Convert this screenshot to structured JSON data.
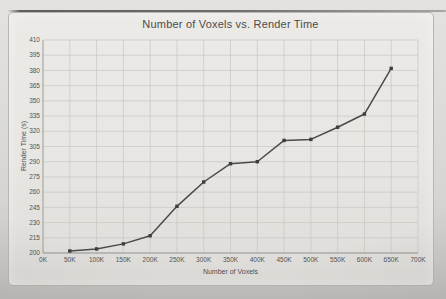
{
  "chart_data": {
    "type": "line",
    "title": "Number of Voxels vs. Render Time",
    "xlabel": "Number of Voxels",
    "ylabel": "Render Time (s)",
    "xlim": [
      0,
      700000
    ],
    "ylim": [
      200,
      410
    ],
    "grid": true,
    "legend": "none",
    "x_ticks": [
      "0K",
      "50K",
      "100K",
      "150K",
      "200K",
      "250K",
      "300K",
      "350K",
      "400K",
      "450K",
      "500K",
      "550K",
      "600K",
      "650K",
      "700K"
    ],
    "x_tick_values": [
      0,
      50000,
      100000,
      150000,
      200000,
      250000,
      300000,
      350000,
      400000,
      450000,
      500000,
      550000,
      600000,
      650000,
      700000
    ],
    "y_ticks": [
      200,
      215,
      230,
      245,
      260,
      275,
      290,
      305,
      320,
      335,
      350,
      365,
      380,
      395,
      410
    ],
    "series": [
      {
        "name": "Render Time",
        "x": [
          50000,
          100000,
          150000,
          200000,
          250000,
          300000,
          350000,
          400000,
          450000,
          500000,
          550000,
          600000,
          650000
        ],
        "values": [
          202,
          204,
          209,
          217,
          246,
          270,
          288,
          290,
          311,
          312,
          324,
          337,
          382
        ]
      }
    ],
    "colors": {
      "line": "#4a4a4a",
      "marker": "#3d3d3d",
      "grid": "#c6c5c1",
      "axis": "#9a9995",
      "text": "#535353"
    }
  }
}
